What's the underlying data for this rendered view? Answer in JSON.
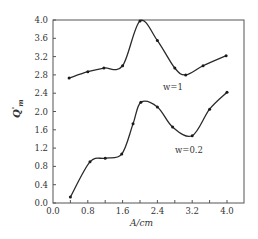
{
  "chart_data": {
    "type": "line",
    "title": "",
    "xlabel": "A/cm",
    "ylabel": "Q'm",
    "xlim": [
      0.0,
      4.2
    ],
    "ylim": [
      0.0,
      4.0
    ],
    "xticks": [
      0.0,
      0.8,
      1.6,
      2.4,
      3.2,
      4.0
    ],
    "xtick_labels": [
      "0.0",
      "0.8",
      "1.6",
      "2.4",
      "3.2",
      "4.0"
    ],
    "yticks": [
      0.0,
      0.4,
      0.8,
      1.2,
      1.6,
      2.0,
      2.4,
      2.8,
      3.2,
      3.6,
      4.0
    ],
    "ytick_labels": [
      "0.0",
      "0.4",
      "0.8",
      "1.2",
      "1.6",
      "2.0",
      "2.4",
      "2.8",
      "3.2",
      "3.6",
      "4.0"
    ],
    "grid": false,
    "legend": "inline annotations",
    "series": [
      {
        "name": "w=1",
        "label_pos": [
          2.6,
          2.6
        ],
        "x": [
          0.37,
          0.8,
          1.17,
          1.6,
          2.0,
          2.4,
          2.8,
          3.05,
          3.45,
          3.98
        ],
        "y": [
          2.73,
          2.87,
          2.95,
          3.0,
          3.98,
          3.55,
          2.95,
          2.8,
          3.0,
          3.22
        ]
      },
      {
        "name": "w=0.2",
        "label_pos": [
          2.85,
          1.2
        ],
        "x": [
          0.4,
          0.85,
          1.2,
          1.58,
          1.84,
          2.02,
          2.4,
          2.75,
          3.2,
          3.6,
          4.0
        ],
        "y": [
          0.13,
          0.9,
          0.98,
          1.07,
          1.73,
          2.2,
          2.1,
          1.66,
          1.47,
          2.05,
          2.42
        ]
      }
    ]
  },
  "labels": {
    "xlabel": "A/cm",
    "ylabel_main": "Q",
    "ylabel_prime": "'",
    "ylabel_sub": "m",
    "series_1": "w=1",
    "series_2": "w=0.2"
  }
}
